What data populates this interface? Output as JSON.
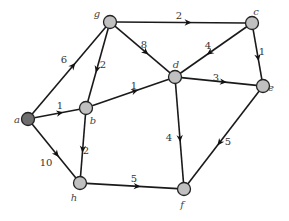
{
  "graph": {
    "type": "directed-weighted",
    "nodes": [
      {
        "id": "a",
        "label": "a",
        "x": 28,
        "y": 119,
        "fill": "#6e6e6e",
        "lx": 17,
        "ly": 123
      },
      {
        "id": "b",
        "label": "b",
        "x": 86,
        "y": 108,
        "fill": "#c0c0c0",
        "lx": 93,
        "ly": 124
      },
      {
        "id": "g",
        "label": "g",
        "x": 110,
        "y": 22,
        "fill": "#c0c0c0",
        "lx": 97,
        "ly": 17
      },
      {
        "id": "c",
        "label": "c",
        "x": 252,
        "y": 23,
        "fill": "#c0c0c0",
        "lx": 256,
        "ly": 15
      },
      {
        "id": "d",
        "label": "d",
        "x": 175,
        "y": 77,
        "fill": "#c0c0c0",
        "lx": 176,
        "ly": 68
      },
      {
        "id": "e",
        "label": "e",
        "x": 263,
        "y": 86,
        "fill": "#c0c0c0",
        "lx": 271,
        "ly": 91
      },
      {
        "id": "h",
        "label": "h",
        "x": 80,
        "y": 183,
        "fill": "#c0c0c0",
        "lx": 74,
        "ly": 201
      },
      {
        "id": "f",
        "label": "f",
        "x": 184,
        "y": 189,
        "fill": "#c0c0c0",
        "lx": 182,
        "ly": 208
      }
    ],
    "edges": [
      {
        "from": "a",
        "to": "g",
        "weight": "6",
        "lx": 64,
        "ly": 63
      },
      {
        "from": "a",
        "to": "b",
        "weight": "1",
        "lx": 60,
        "ly": 109
      },
      {
        "from": "a",
        "to": "h",
        "weight": "10",
        "lx": 46,
        "ly": 166
      },
      {
        "from": "g",
        "to": "c",
        "weight": "2",
        "lx": 179,
        "ly": 19
      },
      {
        "from": "g",
        "to": "b",
        "weight": "2",
        "lx": 103,
        "ly": 68
      },
      {
        "from": "g",
        "to": "d",
        "weight": "8",
        "lx": 144,
        "ly": 48
      },
      {
        "from": "c",
        "to": "d",
        "weight": "4",
        "lx": 208,
        "ly": 49
      },
      {
        "from": "c",
        "to": "e",
        "weight": "1",
        "lx": 262,
        "ly": 55
      },
      {
        "from": "b",
        "to": "d",
        "weight": "1",
        "lx": 134,
        "ly": 89
      },
      {
        "from": "d",
        "to": "e",
        "weight": "3",
        "lx": 216,
        "ly": 81
      },
      {
        "from": "d",
        "to": "f",
        "weight": "4",
        "lx": 169,
        "ly": 141
      },
      {
        "from": "e",
        "to": "f",
        "weight": "5",
        "lx": 228,
        "ly": 145
      },
      {
        "from": "b",
        "to": "h",
        "weight": "2",
        "lx": 86,
        "ly": 154
      },
      {
        "from": "h",
        "to": "f",
        "weight": "5",
        "lx": 134,
        "ly": 182
      }
    ]
  }
}
